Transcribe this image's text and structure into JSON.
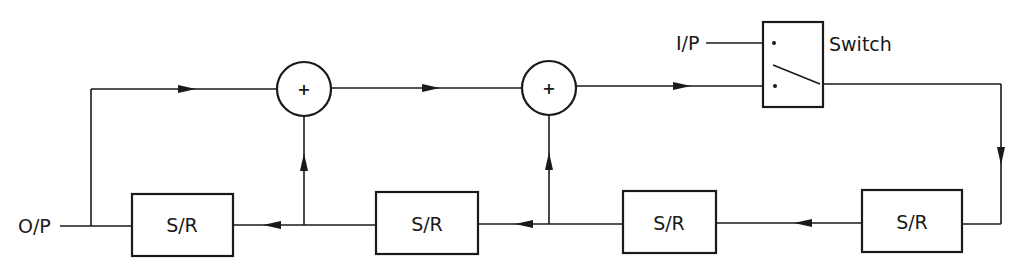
{
  "diagram": {
    "type": "block-diagram",
    "labels": {
      "output": "O/P",
      "input": "I/P",
      "switch": "Switch"
    },
    "adders": [
      {
        "id": "adder-1",
        "symbol": "+"
      },
      {
        "id": "adder-2",
        "symbol": "+"
      }
    ],
    "blocks": [
      {
        "id": "sr-1",
        "label": "S/R"
      },
      {
        "id": "sr-2",
        "label": "S/R"
      },
      {
        "id": "sr-3",
        "label": "S/R"
      },
      {
        "id": "sr-4",
        "label": "S/R"
      }
    ],
    "colors": {
      "line": "#1a1a1a",
      "background": "#ffffff"
    }
  }
}
